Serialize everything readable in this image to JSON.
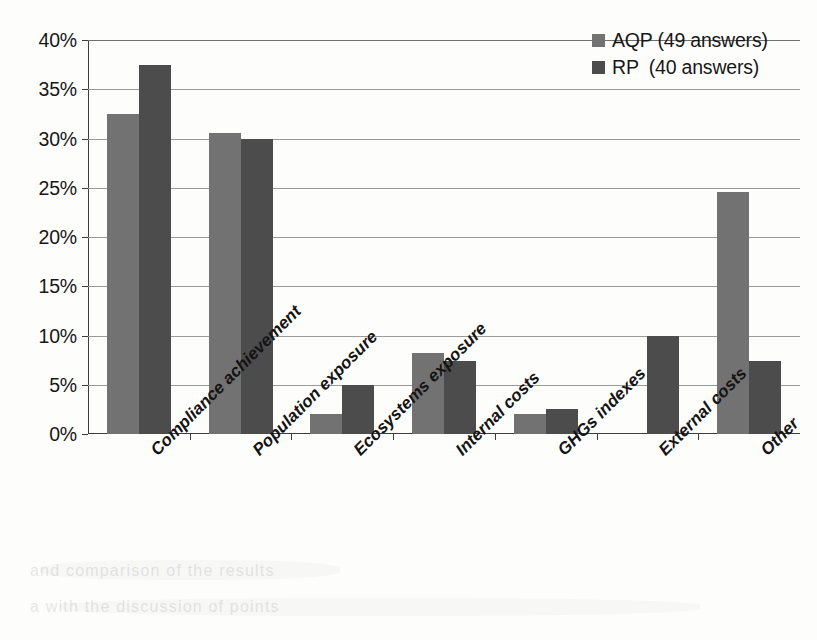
{
  "chart_data": {
    "type": "bar",
    "title": "",
    "xlabel": "",
    "ylabel": "",
    "ylim": [
      0,
      40
    ],
    "ytick_labels": [
      "0%",
      "5%",
      "10%",
      "15%",
      "20%",
      "25%",
      "30%",
      "35%",
      "40%"
    ],
    "ytick_values": [
      0,
      5,
      10,
      15,
      20,
      25,
      30,
      35,
      40
    ],
    "grid": true,
    "legend_position": "top-right",
    "categories": [
      "Compliance achievement",
      "Population exposure",
      "Ecosystems exposure",
      "Internal costs",
      "GHGs indexes",
      "External costs",
      "Other"
    ],
    "series": [
      {
        "name": "AQP",
        "legend_label": "AQP (49 answers)",
        "answers": 49,
        "color": "#727272",
        "values": [
          32.5,
          30.6,
          2.0,
          8.2,
          2.0,
          0.0,
          24.6
        ]
      },
      {
        "name": "RP",
        "legend_label": "RP  (40 answers)",
        "answers": 40,
        "color": "#4c4c4c",
        "values": [
          37.5,
          30.0,
          5.0,
          7.4,
          2.5,
          10.0,
          7.4
        ]
      }
    ]
  },
  "scan_artifacts": {
    "bleed_lines": [
      "and  comparison  of  the  results",
      "a  with  the  discussion  of  points"
    ]
  }
}
